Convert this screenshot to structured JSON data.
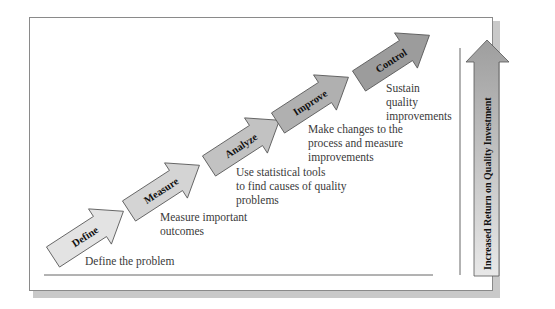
{
  "diagram": {
    "title": "",
    "steps": [
      {
        "label": "Define",
        "description": [
          "Define the problem"
        ],
        "fill": "#e3e3e3"
      },
      {
        "label": "Measure",
        "description": [
          "Measure important",
          "outcomes"
        ],
        "fill": "#d4d4d4"
      },
      {
        "label": "Analyze",
        "description": [
          "Use statistical tools",
          "to find causes of quality",
          "problems"
        ],
        "fill": "#c2c2c2"
      },
      {
        "label": "Improve",
        "description": [
          "Make changes to the",
          "process and measure",
          "improvements"
        ],
        "fill": "#b0b0b0"
      },
      {
        "label": "Control",
        "description": [
          "Sustain",
          "quality",
          "improvements"
        ],
        "fill": "#9c9c9c"
      }
    ],
    "vertical_arrow": {
      "label": "Increased Return on Quality Investment",
      "fill_top": "#a0a0a0",
      "fill_bottom": "#e6e6e6"
    },
    "colors": {
      "frame_border": "#8a8a8a",
      "arrow_stroke": "#555555",
      "axis_line": "#666666"
    }
  }
}
